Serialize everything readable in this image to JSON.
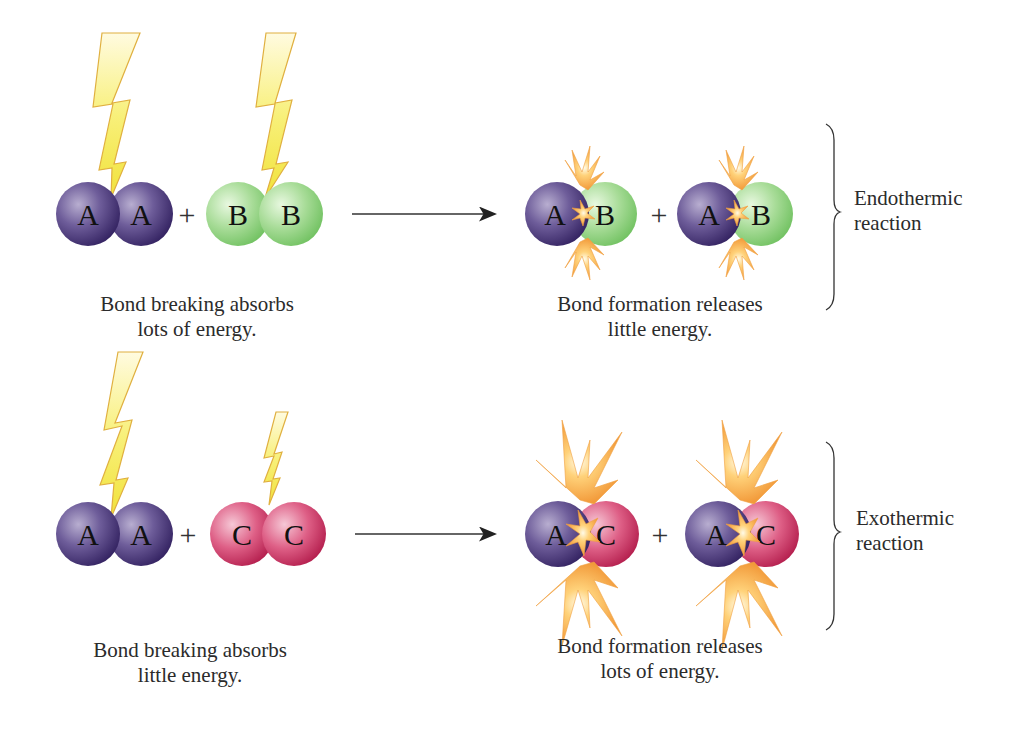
{
  "colors": {
    "atom_A": "#5a4785",
    "atom_B": "#9fd88f",
    "atom_C": "#d8466e",
    "lightning": "#f4ee5a",
    "burst": "#f3a040",
    "text": "#2b2b2b"
  },
  "rows": [
    {
      "id": "endothermic",
      "reactants": [
        {
          "molecule": "AA",
          "letters": [
            "A",
            "A"
          ],
          "lightning": "large"
        },
        {
          "molecule": "BB",
          "letters": [
            "B",
            "B"
          ],
          "lightning": "large"
        }
      ],
      "plus": "+",
      "products": [
        {
          "molecule": "AB",
          "letters": [
            "A",
            "B"
          ],
          "burst": "small"
        },
        {
          "molecule": "AB",
          "letters": [
            "A",
            "B"
          ],
          "burst": "small"
        }
      ],
      "reactant_caption": [
        "Bond breaking absorbs",
        "lots of energy."
      ],
      "product_caption": [
        "Bond formation releases",
        "little energy."
      ],
      "reaction_label": [
        "Endothermic",
        "reaction"
      ]
    },
    {
      "id": "exothermic",
      "reactants": [
        {
          "molecule": "AA",
          "letters": [
            "A",
            "A"
          ],
          "lightning": "large"
        },
        {
          "molecule": "CC",
          "letters": [
            "C",
            "C"
          ],
          "lightning": "small"
        }
      ],
      "plus": "+",
      "products": [
        {
          "molecule": "AC",
          "letters": [
            "A",
            "C"
          ],
          "burst": "large"
        },
        {
          "molecule": "AC",
          "letters": [
            "A",
            "C"
          ],
          "burst": "large"
        }
      ],
      "reactant_caption": [
        "Bond breaking absorbs",
        "little energy."
      ],
      "product_caption": [
        "Bond formation releases",
        "lots of energy."
      ],
      "reaction_label": [
        "Exothermic",
        "reaction"
      ]
    }
  ]
}
